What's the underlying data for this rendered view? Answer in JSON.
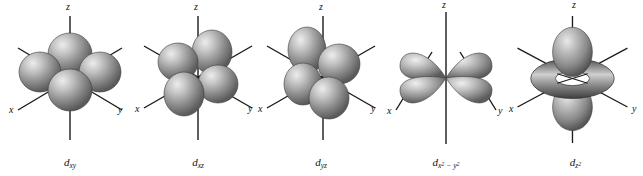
{
  "figure": {
    "title": "Shapes of the five d orbitals",
    "background_color": "#ffffff",
    "width": 643,
    "height": 176,
    "lobe_color_light": "#e8e8e8",
    "lobe_color_mid": "#9a9a9a",
    "lobe_color_dark": "#4f4f4f",
    "axis_color": "#1a1a1a"
  },
  "orbitals": [
    {
      "id": "dxy",
      "label_main": "d",
      "label_sub": "xy",
      "label_sub_sup": "",
      "shape": "four-lobe-between-axes",
      "axes": {
        "z": "z",
        "x": "x",
        "y": "y"
      },
      "panel_left": 6
    },
    {
      "id": "dxz",
      "label_main": "d",
      "label_sub": "xz",
      "label_sub_sup": "",
      "shape": "four-lobe-between-axes",
      "axes": {
        "z": "z",
        "x": "x",
        "y": "y"
      },
      "panel_left": 134
    },
    {
      "id": "dyz",
      "label_main": "d",
      "label_sub": "yz",
      "label_sub_sup": "",
      "shape": "four-lobe-between-axes",
      "axes": {
        "z": "z",
        "x": "x",
        "y": "y"
      },
      "panel_left": 257
    },
    {
      "id": "dx2y2",
      "label_main": "d",
      "label_sub": "x",
      "label_sub_sup": "2",
      "label_sub_tail": " − y",
      "label_sub_tail_sup": "2",
      "shape": "four-lobe-along-axes",
      "axes": {
        "z": "z",
        "x": "x",
        "y": "y"
      },
      "panel_left": 382
    },
    {
      "id": "dz2",
      "label_main": "d",
      "label_sub": "z",
      "label_sub_sup": "2",
      "shape": "dumbbell-with-torus",
      "axes": {
        "z": "z",
        "x": "x",
        "y": "y"
      },
      "panel_left": 508
    }
  ]
}
